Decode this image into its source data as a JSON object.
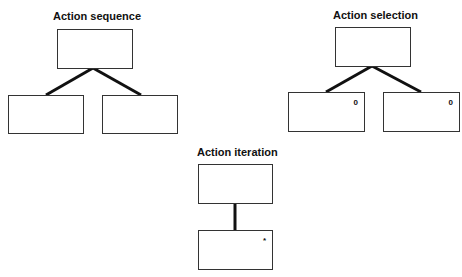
{
  "diagrams": {
    "sequence": {
      "title": "Action sequence",
      "children": [
        {
          "mark": ""
        },
        {
          "mark": ""
        }
      ]
    },
    "selection": {
      "title": "Action selection",
      "children": [
        {
          "mark": "0"
        },
        {
          "mark": "0"
        }
      ]
    },
    "iteration": {
      "title": "Action iteration",
      "children": [
        {
          "mark": "*"
        }
      ]
    }
  },
  "colors": {
    "line": "#111111",
    "border": "#333333",
    "background": "#ffffff"
  }
}
